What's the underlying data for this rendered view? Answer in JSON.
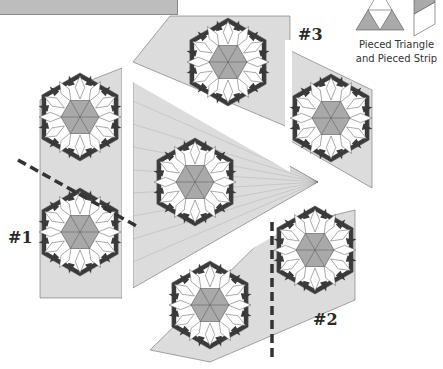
{
  "diagram": {
    "type": "quilt-assembly",
    "colors": {
      "background": "#ffffff",
      "medium_gray": "#a9a9a9",
      "light_gray": "#dcdcdc",
      "dark": "#3a3a3a",
      "white": "#ffffff",
      "print": "#9a9a9a",
      "outline": "#555555",
      "dash": "#333333",
      "top_bar": "#bdbdbd"
    },
    "section_labels": [
      {
        "id": "section-1",
        "text": "#1",
        "x": 8,
        "y": 228
      },
      {
        "id": "section-2",
        "text": "#2",
        "x": 313,
        "y": 310
      },
      {
        "id": "section-3",
        "text": "#3",
        "x": 298,
        "y": 25
      }
    ],
    "legend": {
      "line1": "Pieced Triangle",
      "line2": "and Pieced Strip"
    },
    "star_blocks": [
      {
        "id": "block-top",
        "cx": 228,
        "cy": 62
      },
      {
        "id": "block-right-upper",
        "cx": 331,
        "cy": 118
      },
      {
        "id": "block-left-upper",
        "cx": 80,
        "cy": 117
      },
      {
        "id": "block-left-lower",
        "cx": 80,
        "cy": 232
      },
      {
        "id": "block-center",
        "cx": 195,
        "cy": 182
      },
      {
        "id": "block-right-lower",
        "cx": 315,
        "cy": 250
      },
      {
        "id": "block-bottom",
        "cx": 210,
        "cy": 305
      }
    ],
    "seam_lines": [
      {
        "id": "seam-1",
        "x1": 18,
        "y1": 160,
        "x2": 140,
        "y2": 228
      },
      {
        "id": "seam-2",
        "x1": 272,
        "y1": 222,
        "x2": 272,
        "y2": 362
      }
    ]
  }
}
